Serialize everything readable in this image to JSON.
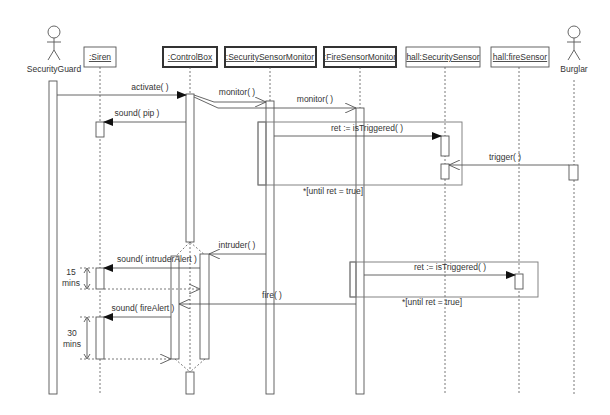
{
  "diagram": {
    "type": "UML sequence diagram",
    "actors": [
      {
        "id": "guard",
        "label": "SecurityGuard"
      },
      {
        "id": "burglar",
        "label": "Burglar"
      }
    ],
    "objects": [
      {
        "id": "siren",
        "label": ":Siren",
        "active": false
      },
      {
        "id": "controlbox",
        "label": ":ControlBox",
        "active": true
      },
      {
        "id": "secmon",
        "label": ":SecuritySensorMonitor",
        "active": true
      },
      {
        "id": "firemon",
        "label": ":FireSensorMonitor",
        "active": true
      },
      {
        "id": "secsensor",
        "label": "hall:SecuritySensor",
        "active": false
      },
      {
        "id": "firesensor",
        "label": "hall:fireSensor",
        "active": false
      }
    ],
    "messages": {
      "activate": "activate( )",
      "monitor1": "monitor( )",
      "monitor2": "monitor( )",
      "sound_pip": "sound( pip )",
      "is_triggered_1": "ret := isTriggered( )",
      "trigger": "trigger( )",
      "loop_guard_1": "*[until ret = true]",
      "intruder": "intruder( )",
      "sound_intruder": "sound( intruderAlert )",
      "is_triggered_2": "ret := isTriggered( )",
      "loop_guard_2": "*[until ret = true]",
      "fire": "fire( )",
      "sound_fire": "sound( fireAlert )"
    },
    "durations": {
      "d1_value": "15",
      "d1_unit": "mins",
      "d2_value": "30",
      "d2_unit": "mins"
    }
  }
}
